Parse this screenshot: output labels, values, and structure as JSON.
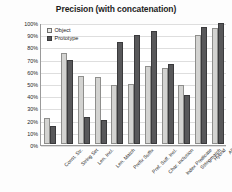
{
  "chart_data": {
    "type": "bar",
    "title": "Precision (with concatenation)",
    "xlabel": "",
    "ylabel": "DPAs  with zero false positive(s)",
    "ylim": [
      0,
      100
    ],
    "ytick_labels": [
      "100%",
      "90%",
      "80%",
      "70%",
      "60%",
      "50%",
      "40%",
      "30%",
      "20%",
      "10%",
      "0%"
    ],
    "ytick_values": [
      100,
      90,
      80,
      70,
      60,
      50,
      40,
      30,
      20,
      10,
      0
    ],
    "grid": true,
    "legend_position": "top-left",
    "categories": [
      "Const. Str.",
      "String Set",
      "Len. Incl.",
      "Len. Match",
      "Prefix Suffix",
      "Pref. Suff. Incl.",
      "Char. Inclusion",
      "Index Predicate",
      "Stringmatch",
      "Hybrid",
      "All"
    ],
    "series": [
      {
        "name": "Object",
        "color": "#d3d3d1",
        "values": [
          21,
          75,
          55.5,
          55,
          48.5,
          49.5,
          64,
          62.5,
          48.5,
          89,
          95
        ]
      },
      {
        "name": "Prototype",
        "color": "#58585a",
        "values": [
          14.5,
          69,
          22.5,
          19.5,
          83.5,
          89.5,
          92.5,
          65.5,
          40.5,
          96,
          99
        ]
      }
    ]
  }
}
